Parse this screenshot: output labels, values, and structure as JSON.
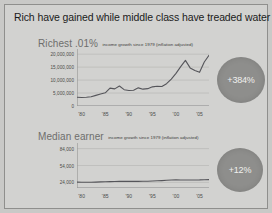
{
  "slide": {
    "title": "Rich have gained while middle class have treaded water",
    "background_color": "#d2d2d0",
    "accent_color": "#8e8e8c"
  },
  "panels": [
    {
      "name": "Richest .01%",
      "subtitle": "income growth since 1979 (inflation adjusted)",
      "badge": "+384%"
    },
    {
      "name": "Median earner",
      "subtitle": "income growth since 1979 (inflation adjusted)",
      "badge": "+12%"
    }
  ],
  "chart_data": [
    {
      "type": "line",
      "title": "Richest .01%",
      "subtitle": "income growth since 1979 (inflation adjusted)",
      "xlabel": "",
      "ylabel": "",
      "grid": true,
      "legend": "none",
      "ylim": [
        0,
        22000000
      ],
      "yticks": [
        5000000,
        10000000,
        15000000,
        20000000
      ],
      "ytick_labels": [
        "5,000,000",
        "10,000,000",
        "15,000,000",
        "20,000,000"
      ],
      "xlim": [
        1979,
        2007
      ],
      "xticks": [
        1980,
        1985,
        1990,
        1995,
        2000,
        2005
      ],
      "xtick_labels": [
        "'80",
        "'85",
        "'90",
        "'95",
        "'00",
        "'05"
      ],
      "x": [
        1979,
        1980,
        1981,
        1982,
        1983,
        1984,
        1985,
        1986,
        1987,
        1988,
        1989,
        1990,
        1991,
        1992,
        1993,
        1994,
        1995,
        1996,
        1997,
        1998,
        1999,
        2000,
        2001,
        2002,
        2003,
        2004,
        2005,
        2006,
        2007
      ],
      "values": [
        3400000,
        3300000,
        3350000,
        3600000,
        4100000,
        4600000,
        5100000,
        6900000,
        6600000,
        7700000,
        6300000,
        6000000,
        6100000,
        7000000,
        6500000,
        6700000,
        7400000,
        7600000,
        7500000,
        8600000,
        10400000,
        12600000,
        15200000,
        17600000,
        14700000,
        13700000,
        13000000,
        17000000,
        19600000
      ],
      "annotation": "+384%"
    },
    {
      "type": "line",
      "title": "Median earner",
      "subtitle": "income growth since 1979 (inflation adjusted)",
      "xlabel": "",
      "ylabel": "",
      "grid": true,
      "legend": "none",
      "ylim": [
        14000,
        94000
      ],
      "yticks": [
        24000,
        54000,
        84000
      ],
      "ytick_labels": [
        "24,000",
        "54,000",
        "84,000"
      ],
      "xlim": [
        1979,
        2007
      ],
      "xticks": [
        1980,
        1985,
        1990,
        1995,
        2000,
        2005
      ],
      "xtick_labels": [
        "'80",
        "'85",
        "'90",
        "'95",
        "'00",
        "'05"
      ],
      "x": [
        1979,
        1980,
        1981,
        1982,
        1983,
        1984,
        1985,
        1986,
        1987,
        1988,
        1989,
        1990,
        1991,
        1992,
        1993,
        1994,
        1995,
        1996,
        1997,
        1998,
        1999,
        2000,
        2001,
        2002,
        2003,
        2004,
        2005,
        2006,
        2007
      ],
      "values": [
        24500,
        24200,
        24100,
        24300,
        24500,
        24900,
        25200,
        25400,
        25500,
        25700,
        25900,
        25800,
        25700,
        25800,
        25900,
        26100,
        26400,
        26800,
        27200,
        27700,
        28100,
        28400,
        28200,
        28100,
        28200,
        28300,
        28400,
        28700,
        28900
      ],
      "annotation": "+12%"
    }
  ]
}
